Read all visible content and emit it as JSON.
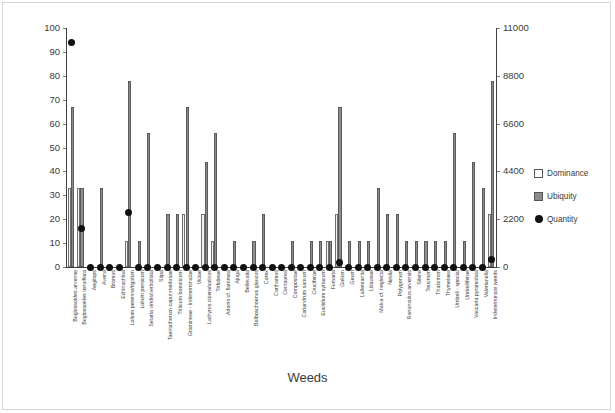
{
  "chart_data": {
    "type": "bar",
    "title": "",
    "xlabel": "Weeds",
    "ylabel": "",
    "ylim": [
      0,
      100
    ],
    "y2lim": [
      0,
      11000
    ],
    "yticks": [
      0,
      10,
      20,
      30,
      40,
      50,
      60,
      70,
      80,
      90,
      100
    ],
    "y2ticks": [
      0,
      2200,
      4400,
      6600,
      8800,
      11000
    ],
    "grid": false,
    "legend_position": "right",
    "legend": [
      "Dominance",
      "Ubiquity",
      "Quantity"
    ],
    "categories": [
      "Buglossoides arvense",
      "Buglossoides tenuiflora",
      "Aegilops",
      "Avena",
      "Bromus",
      "Echinochloa",
      "Lolium perenne/rigidum",
      "Lolium persicum",
      "Setaria viridis/verticillata",
      "Stipa",
      "Taeniatherum caput-medusae",
      "Triticum boeoticum",
      "Gramineae - Indeterminatae",
      "Viciae",
      "Lathyrus cicera/sativus",
      "Trifolieae",
      "Adonis cf. flammea",
      "Ajuga",
      "Bellevalia",
      "Bolboschoenus glaucus",
      "Carex",
      "Carthamus",
      "Centaurea",
      "Compositae",
      "Coriandrum sativum",
      "Cruciferae",
      "Euclidium syriacum",
      "Fumaria",
      "Galium",
      "Geum",
      "Lallemantia",
      "Liliaceae",
      "Malva cf. neglecta",
      "Neslia",
      "Polygonum",
      "Ranunculus arvensis",
      "Silene",
      "Teucrium",
      "Thalictrum",
      "Thymelaea",
      "Umbell - special",
      "Umbelliferae",
      "Vaccaria pyramidata",
      "Valerianella",
      "Indeterminate weeds"
    ],
    "series": [
      {
        "name": "Dominance",
        "axis": "left",
        "values": [
          33,
          33,
          0,
          0,
          0,
          0,
          11,
          0,
          0,
          0,
          0,
          0,
          22,
          0,
          22,
          11,
          0,
          0,
          0,
          0,
          0,
          0,
          0,
          0,
          0,
          0,
          0,
          11,
          22,
          0,
          0,
          0,
          0,
          0,
          0,
          0,
          0,
          0,
          0,
          0,
          0,
          0,
          0,
          0,
          22
        ]
      },
      {
        "name": "Ubiquity",
        "axis": "left",
        "values": [
          67,
          33,
          0,
          33,
          0,
          0,
          78,
          11,
          56,
          0,
          22,
          22,
          67,
          0,
          44,
          56,
          0,
          11,
          0,
          11,
          22,
          0,
          0,
          11,
          0,
          11,
          11,
          11,
          67,
          11,
          11,
          11,
          33,
          22,
          22,
          11,
          11,
          11,
          11,
          11,
          56,
          11,
          44,
          33,
          78
        ]
      },
      {
        "name": "Quantity",
        "axis": "right",
        "values": [
          10340,
          1760,
          0,
          0,
          0,
          0,
          2530,
          0,
          0,
          0,
          0,
          0,
          0,
          0,
          0,
          0,
          0,
          0,
          0,
          0,
          0,
          0,
          0,
          0,
          0,
          0,
          0,
          0,
          220,
          0,
          0,
          0,
          0,
          0,
          0,
          0,
          0,
          0,
          0,
          0,
          0,
          0,
          0,
          0,
          330
        ]
      }
    ]
  },
  "legend": {
    "items": [
      {
        "label": "Dominance",
        "key": "dominance-swatch",
        "color": "#ffffff"
      },
      {
        "label": "Ubiquity",
        "key": "ubiquity-swatch",
        "color": "#8c8c8c"
      },
      {
        "label": "Quantity",
        "key": "quantity-marker",
        "color": "#111111"
      }
    ]
  },
  "axis_title": {
    "x": "Weeds"
  }
}
